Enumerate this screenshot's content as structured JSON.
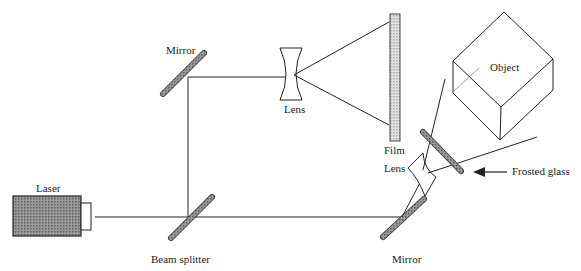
{
  "diagram": {
    "labels": {
      "laser": "Laser",
      "beam_splitter": "Beam splitter",
      "mirror_top": "Mirror",
      "mirror_bottom": "Mirror",
      "lens_top": "Lens",
      "lens_bottom": "Lens",
      "film": "Film",
      "object": "Object",
      "frosted_glass": "Frosted glass"
    },
    "colors": {
      "line": "#222222",
      "laser_fill": "#8a8a8a",
      "mirror_fill": "#7a7a7a",
      "film_fill": "#cfcfcf"
    }
  }
}
